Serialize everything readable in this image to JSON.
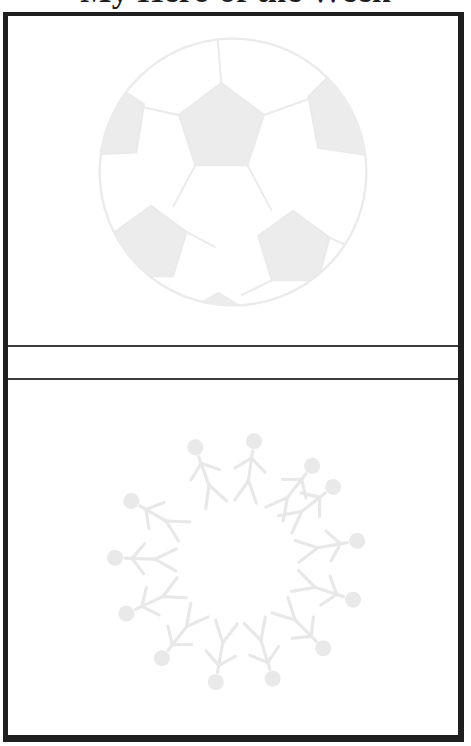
{
  "page": {
    "title": "My Hero of the Week"
  },
  "colors": {
    "background": "#ffffff",
    "frame_border": "#1f1f1f",
    "divider_line": "#3c3c3c",
    "watermark_gray": "#ececec",
    "title_text": "#1d1d1d"
  },
  "watermarks": {
    "top_box": "soccer-ball",
    "bottom_box": "circle-of-people-heads-outward"
  }
}
